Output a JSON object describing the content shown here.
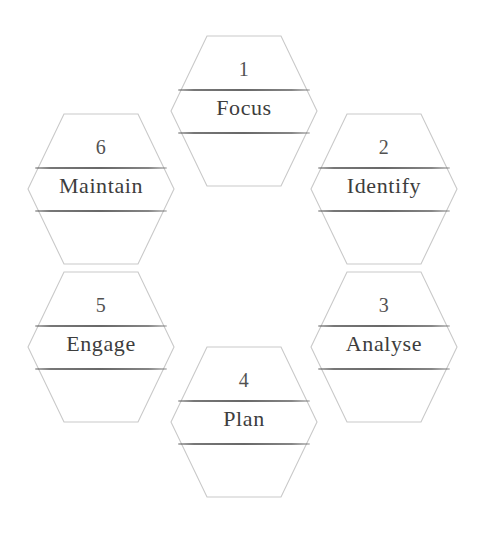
{
  "diagram": {
    "shape": "flat-top-hexagon",
    "arrangement": "honeycomb-ring",
    "background_color": "#ffffff",
    "outline_color": "#c9c9c9",
    "rule_color": "#3a3a3a",
    "text_color": "#2d2d2d",
    "step_count": "6"
  },
  "steps": [
    {
      "number": "1",
      "label": "Focus",
      "position": "top-center"
    },
    {
      "number": "2",
      "label": "Identify",
      "position": "upper-right"
    },
    {
      "number": "3",
      "label": "Analyse",
      "position": "lower-right"
    },
    {
      "number": "4",
      "label": "Plan",
      "position": "bottom-center"
    },
    {
      "number": "5",
      "label": "Engage",
      "position": "lower-left"
    },
    {
      "number": "6",
      "label": "Maintain",
      "position": "upper-left"
    }
  ]
}
